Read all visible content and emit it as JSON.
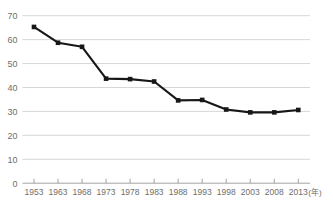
{
  "chart_data": {
    "type": "line",
    "title": "",
    "xlabel": "",
    "ylabel": "",
    "x_unit_label": "(年)",
    "categories": [
      "1953",
      "1963",
      "1968",
      "1973",
      "1978",
      "1983",
      "1988",
      "1993",
      "1998",
      "2003",
      "2008",
      "2013"
    ],
    "values": [
      65.3,
      58.7,
      57.0,
      43.7,
      43.5,
      42.5,
      34.6,
      34.8,
      30.8,
      29.6,
      29.6,
      30.6
    ],
    "series": [
      {
        "name": "",
        "values": [
          65.3,
          58.7,
          57.0,
          43.7,
          43.5,
          42.5,
          34.6,
          34.8,
          30.8,
          29.6,
          29.6,
          30.6
        ]
      }
    ],
    "ylim": [
      0,
      70
    ],
    "ytick_labels": [
      "0",
      "10",
      "20",
      "30",
      "40",
      "50",
      "60",
      "70"
    ],
    "ytick_values": [
      0,
      10,
      20,
      30,
      40,
      50,
      60,
      70
    ],
    "grid": true,
    "legend": false,
    "marker": "square",
    "line_color": "#171717",
    "grid_color": "#d2d2d2",
    "axis_color": "#9a9a9a",
    "label_color": "#6e6e6e",
    "background_color": "#ffffff"
  }
}
